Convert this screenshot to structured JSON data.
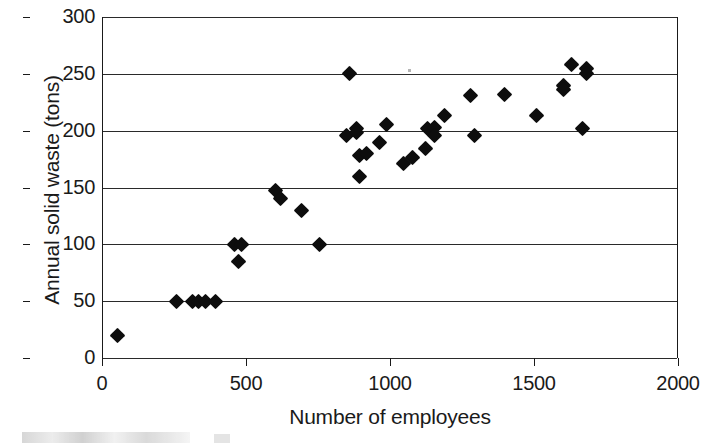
{
  "chart_data": {
    "type": "scatter",
    "title": "",
    "xlabel": "Number of employees",
    "ylabel": "Annual solid waste (tons)",
    "xlim": [
      0,
      2000
    ],
    "ylim": [
      0,
      300
    ],
    "xticks": [
      0,
      500,
      1000,
      1500,
      2000
    ],
    "yticks": [
      0,
      50,
      100,
      150,
      200,
      250,
      300
    ],
    "xticklabels": [
      "0",
      "500",
      "1000",
      "1500",
      "2000"
    ],
    "yticklabels": [
      "0",
      "50",
      "100",
      "150",
      "200",
      "250",
      "300"
    ],
    "grid": "horizontal",
    "legend": "none",
    "marker": "filled-diamond",
    "marker_color": "#0d0d0d",
    "points": [
      {
        "x": 50,
        "y": 20
      },
      {
        "x": 255,
        "y": 50
      },
      {
        "x": 310,
        "y": 50
      },
      {
        "x": 330,
        "y": 50
      },
      {
        "x": 355,
        "y": 50
      },
      {
        "x": 390,
        "y": 50
      },
      {
        "x": 455,
        "y": 100
      },
      {
        "x": 480,
        "y": 100
      },
      {
        "x": 470,
        "y": 85
      },
      {
        "x": 600,
        "y": 147
      },
      {
        "x": 615,
        "y": 140
      },
      {
        "x": 690,
        "y": 130
      },
      {
        "x": 750,
        "y": 100
      },
      {
        "x": 855,
        "y": 250
      },
      {
        "x": 845,
        "y": 196
      },
      {
        "x": 880,
        "y": 202
      },
      {
        "x": 880,
        "y": 198
      },
      {
        "x": 890,
        "y": 178
      },
      {
        "x": 915,
        "y": 180
      },
      {
        "x": 890,
        "y": 160
      },
      {
        "x": 960,
        "y": 190
      },
      {
        "x": 985,
        "y": 205
      },
      {
        "x": 1045,
        "y": 171
      },
      {
        "x": 1075,
        "y": 176
      },
      {
        "x": 1120,
        "y": 184
      },
      {
        "x": 1125,
        "y": 202
      },
      {
        "x": 1150,
        "y": 203
      },
      {
        "x": 1150,
        "y": 196
      },
      {
        "x": 1185,
        "y": 213
      },
      {
        "x": 1275,
        "y": 231
      },
      {
        "x": 1290,
        "y": 196
      },
      {
        "x": 1395,
        "y": 232
      },
      {
        "x": 1505,
        "y": 213
      },
      {
        "x": 1600,
        "y": 240
      },
      {
        "x": 1600,
        "y": 236
      },
      {
        "x": 1625,
        "y": 258
      },
      {
        "x": 1680,
        "y": 255
      },
      {
        "x": 1680,
        "y": 250
      },
      {
        "x": 1665,
        "y": 202
      }
    ]
  }
}
